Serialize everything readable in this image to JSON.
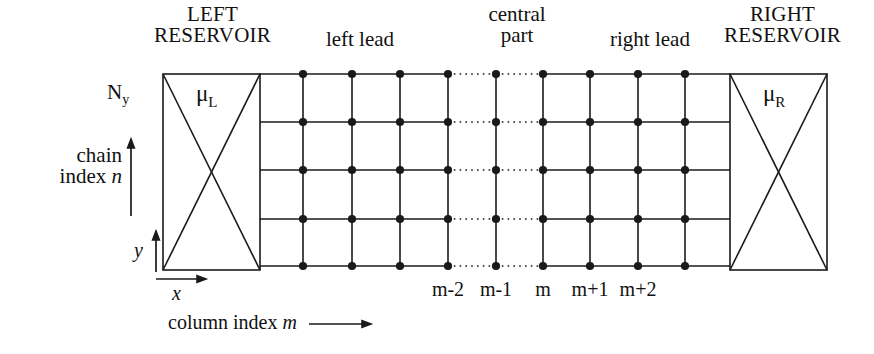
{
  "figure": {
    "type": "lattice-transport-diagram",
    "title_visible": false,
    "background": "#ffffff",
    "line_color": "#1a1a1a",
    "labels": {
      "left_reservoir_line1": "LEFT",
      "left_reservoir_line2": "RESERVOIR",
      "right_reservoir_line1": "RIGHT",
      "right_reservoir_line2": "RESERVOIR",
      "left_lead": "left lead",
      "central_part_line1": "central",
      "central_part_line2": "part",
      "right_lead": "right lead",
      "mu_left": "μ",
      "mu_left_sub": "L",
      "mu_right": "μ",
      "mu_right_sub": "R",
      "ny": "N",
      "ny_sub": "y",
      "chain_index_line1": "chain",
      "chain_index_line2": "index",
      "chain_index_symbol": "n",
      "axis_y": "y",
      "axis_x": "x",
      "column_index_text": "column index",
      "column_index_symbol": "m",
      "column_ticks": [
        "m-2",
        "m-1",
        "m",
        "m+1",
        "m+2"
      ]
    }
  },
  "chart_data": {
    "type": "diagram",
    "lattice": {
      "n_columns": 9,
      "n_rows": 5,
      "column_x": [
        303,
        352,
        400,
        448,
        496,
        543,
        590,
        638,
        685
      ],
      "row_y": [
        74,
        122,
        170,
        219,
        266
      ],
      "dotted_link_columns": [
        [
          448,
          496
        ],
        [
          496,
          543
        ]
      ],
      "column_labels_at": [
        448,
        496,
        543,
        590,
        638
      ],
      "column_labels": [
        "m-2",
        "m-1",
        "m",
        "m+1",
        "m+2"
      ]
    },
    "reservoirs": [
      {
        "name": "LEFT RESERVOIR",
        "x": 163,
        "y": 74,
        "width": 97,
        "height": 196,
        "chemical_potential": "μL",
        "marking": "X-cross"
      },
      {
        "name": "RIGHT RESERVOIR",
        "x": 730,
        "y": 74,
        "width": 97,
        "height": 196,
        "chemical_potential": "μR",
        "marking": "X-cross"
      }
    ],
    "rails": {
      "x_start": 260,
      "x_end": 730
    },
    "axes": {
      "y_arrow": {
        "x": 156,
        "y_from": 272,
        "y_to": 231,
        "label": "y"
      },
      "x_arrow": {
        "y": 279,
        "x_from": 156,
        "x_to": 206,
        "label": "x"
      },
      "chain_arrow": {
        "x": 131,
        "y_from": 216,
        "y_to": 139,
        "label": "chain index n"
      },
      "column_arrow": {
        "y": 324,
        "x_from": 309,
        "x_to": 371,
        "label": "column index m"
      }
    }
  }
}
